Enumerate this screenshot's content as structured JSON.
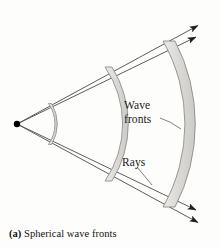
{
  "figure": {
    "caption_tag": "(a)",
    "caption_text": "Spherical wave fronts",
    "labels": {
      "wave_fronts_line1": "Wave",
      "wave_fronts_line2": "fronts",
      "rays": "Rays"
    },
    "colors": {
      "background": "#fdfdfc",
      "line": "#5c5c5c",
      "line_dark": "#3a3a3a",
      "arrowhead": "#1f1f1f",
      "source_point": "#000000",
      "wavefront_fill": "#d9d7d3",
      "wavefront_fill_light": "#e6e4e0",
      "wavefront_stroke": "#8a8a86",
      "label_text": "#1a1a1a",
      "caption_text": "#121212"
    },
    "elements": {
      "source_point": {
        "name": "point source",
        "x": 17,
        "y": 124,
        "radius": 3.2
      },
      "rays": [
        {
          "id": "ray-upper-outer",
          "x1": 17,
          "y1": 124,
          "x2": 205,
          "y2": 22
        },
        {
          "id": "ray-upper-inner",
          "x1": 17,
          "y1": 124,
          "x2": 203,
          "y2": 34
        },
        {
          "id": "ray-lower-inner",
          "x1": 17,
          "y1": 124,
          "x2": 203,
          "y2": 213
        },
        {
          "id": "ray-lower-outer",
          "x1": 17,
          "y1": 124,
          "x2": 205,
          "y2": 226
        }
      ],
      "arrow_count": 4,
      "wave_fronts": [
        {
          "id": "wavefront-inner",
          "radius": 36,
          "thickness": 3,
          "span_deg": 58
        },
        {
          "id": "wavefront-middle",
          "radius": 101,
          "thickness": 7,
          "span_deg": 58
        },
        {
          "id": "wavefront-outer",
          "radius": 168,
          "thickness": 12,
          "span_deg": 58
        }
      ],
      "leader_lines": [
        {
          "id": "leader-wave-fronts",
          "x1": 160,
          "y1": 118,
          "x2": 180,
          "y2": 129
        },
        {
          "id": "leader-rays",
          "x1": 137,
          "y1": 167,
          "x2": 151,
          "y2": 183
        }
      ]
    }
  }
}
